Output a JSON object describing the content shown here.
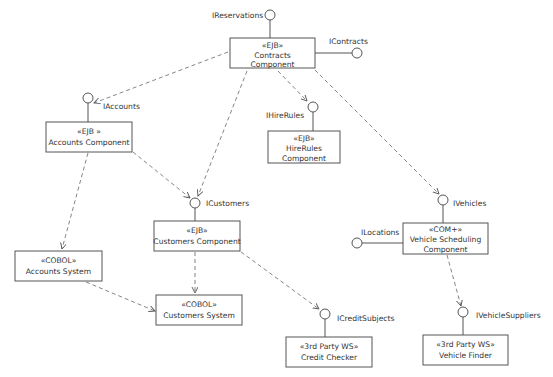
{
  "diagram": {
    "type": "UML component diagram",
    "components": [
      {
        "id": "contracts",
        "stereotype": "«EJB»",
        "lines": [
          "Contracts",
          "Component"
        ],
        "x": 230,
        "y": 38,
        "w": 85,
        "h": 30
      },
      {
        "id": "accounts",
        "stereotype": "«EJB »",
        "lines": [
          "Accounts Component"
        ],
        "x": 46,
        "y": 122,
        "w": 86,
        "h": 30
      },
      {
        "id": "hirerules",
        "stereotype": "«EJB»",
        "lines": [
          "HireRules",
          "Component"
        ],
        "x": 268,
        "y": 131,
        "w": 72,
        "h": 32
      },
      {
        "id": "customers",
        "stereotype": "«EJB»",
        "lines": [
          "Customers Component"
        ],
        "x": 154,
        "y": 221,
        "w": 86,
        "h": 30
      },
      {
        "id": "vehiclescheduling",
        "stereotype": "«COM+»",
        "lines": [
          "Vehicle Scheduling",
          "Component"
        ],
        "x": 403,
        "y": 223,
        "w": 85,
        "h": 31
      },
      {
        "id": "accountssystem",
        "stereotype": "«COBOL»",
        "lines": [
          "Accounts System"
        ],
        "x": 15,
        "y": 251,
        "w": 87,
        "h": 30
      },
      {
        "id": "customerssystem",
        "stereotype": "«COBOL»",
        "lines": [
          "Customers System"
        ],
        "x": 156,
        "y": 295,
        "w": 86,
        "h": 30
      },
      {
        "id": "creditchecker",
        "stereotype": "«3rd Party WS»",
        "lines": [
          "Credit Checker"
        ],
        "x": 286,
        "y": 337,
        "w": 86,
        "h": 30
      },
      {
        "id": "vehiclefinder",
        "stereotype": "«3rd Party WS»",
        "lines": [
          "Vehicle Finder"
        ],
        "x": 423,
        "y": 335,
        "w": 85,
        "h": 30
      }
    ],
    "interfaces": [
      {
        "id": "ireservations",
        "label": "IReservations",
        "cx": 270,
        "cy": 15
      },
      {
        "id": "icontracts",
        "label": "IContracts",
        "cx": 357,
        "cy": 53
      },
      {
        "id": "iaccounts",
        "label": "IAccounts",
        "cx": 88,
        "cy": 98
      },
      {
        "id": "ihirerules",
        "label": "IHireRules",
        "cx": 313,
        "cy": 107
      },
      {
        "id": "icustomers",
        "label": "ICustomers",
        "cx": 195,
        "cy": 203
      },
      {
        "id": "ivehicles",
        "label": "IVehicles",
        "cx": 443,
        "cy": 200
      },
      {
        "id": "ilocations",
        "label": "ILocations",
        "cx": 357,
        "cy": 243
      },
      {
        "id": "icreditsubjects",
        "label": "ICreditSubjects",
        "cx": 325,
        "cy": 314
      },
      {
        "id": "ivehiclesuppliers",
        "label": "IVehicleSuppliers",
        "cx": 463,
        "cy": 312
      }
    ],
    "dependencies": [
      {
        "from": "Contracts Component",
        "to": "IAccounts"
      },
      {
        "from": "Contracts Component",
        "to": "ICustomers"
      },
      {
        "from": "Contracts Component",
        "to": "IHireRules"
      },
      {
        "from": "Contracts Component",
        "to": "IVehicles"
      },
      {
        "from": "Accounts Component",
        "to": "ICustomers"
      },
      {
        "from": "Accounts Component",
        "to": "Accounts System"
      },
      {
        "from": "Customers Component",
        "to": "Customers System"
      },
      {
        "from": "Customers Component",
        "to": "ICreditSubjects"
      },
      {
        "from": "Accounts System",
        "to": "Customers System"
      },
      {
        "from": "Vehicle Scheduling Component",
        "to": "IVehicleSuppliers"
      }
    ]
  },
  "labels": {
    "contracts": {
      "stereo": "«EJB»",
      "l1": "Contracts",
      "l2": "Component"
    },
    "accounts": {
      "stereo": "«EJB »",
      "l1": "Accounts Component"
    },
    "hirerules": {
      "stereo": "«EJB»",
      "l1": "HireRules",
      "l2": "Component"
    },
    "customers": {
      "stereo": "«EJB»",
      "l1": "Customers Component"
    },
    "vehiclescheduling": {
      "stereo": "«COM+»",
      "l1": "Vehicle Scheduling",
      "l2": "Component"
    },
    "accountssystem": {
      "stereo": "«COBOL»",
      "l1": "Accounts System"
    },
    "customerssystem": {
      "stereo": "«COBOL»",
      "l1": "Customers System"
    },
    "creditchecker": {
      "stereo": "«3rd Party WS»",
      "l1": "Credit Checker"
    },
    "vehiclefinder": {
      "stereo": "«3rd Party WS»",
      "l1": "Vehicle Finder"
    },
    "ireservations": "IReservations",
    "icontracts": "IContracts",
    "iaccounts": "IAccounts",
    "ihirerules": "IHireRules",
    "icustomers": "ICustomers",
    "ivehicles": "IVehicles",
    "ilocations": "ILocations",
    "icreditsubjects": "ICreditSubjects",
    "ivehiclesuppliers": "IVehicleSuppliers"
  }
}
